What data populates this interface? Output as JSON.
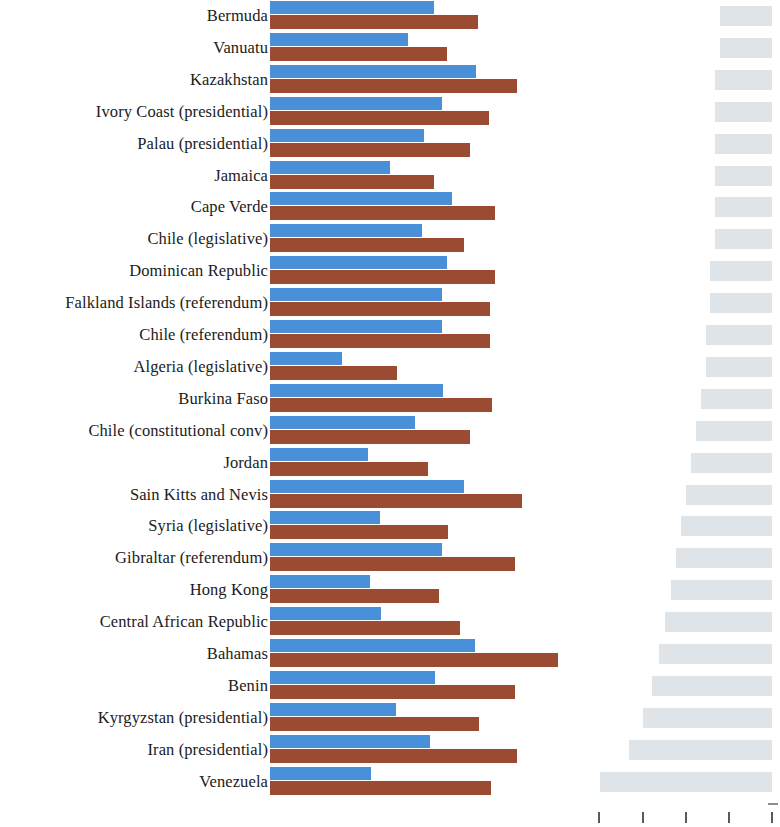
{
  "chart_data": {
    "type": "bar",
    "orientation": "horizontal",
    "title": "",
    "subtitle": "",
    "xlabel": "",
    "ylabel": "",
    "grid": false,
    "legend": null,
    "panels": [
      {
        "name": "paired-bars-panel",
        "position": "left",
        "bar_origin_x_px": 270,
        "series": [
          {
            "name": "series-blue",
            "color": "#4a90d9"
          },
          {
            "name": "series-brown",
            "color": "#9c4b33"
          }
        ]
      },
      {
        "name": "gray-bars-panel",
        "position": "right",
        "bar_alignment": "right",
        "series": [
          {
            "name": "series-gray",
            "color": "#dfe4e8"
          }
        ],
        "axis": {
          "ticks_count": 5,
          "tick_labels": [
            "",
            "",
            "",
            "",
            ""
          ],
          "tick_positions_px": [
            598,
            642,
            685,
            728,
            771
          ]
        }
      }
    ],
    "categories": [
      "Bermuda",
      "Vanuatu",
      "Kazakhstan",
      "Ivory Coast (presidential)",
      "Palau (presidential)",
      "Jamaica",
      "Cape Verde",
      "Chile (legislative)",
      "Dominican Republic",
      "Falkland Islands (referendum)",
      "Chile (referendum)",
      "Algeria (legislative)",
      "Burkina Faso",
      "Chile (constitutional conv)",
      "Jordan",
      "Sain Kitts and Nevis",
      "Syria (legislative)",
      "Gibraltar (referendum)",
      "Hong Kong",
      "Central African Republic",
      "Bahamas",
      "Benin",
      "Kyrgyzstan (presidential)",
      "Iran (presidential)",
      "Venezuela"
    ],
    "rows": [
      {
        "label": "Bermuda",
        "blue_px": 164,
        "brown_px": 208,
        "gray_px": 52
      },
      {
        "label": "Vanuatu",
        "blue_px": 138,
        "brown_px": 177,
        "gray_px": 52
      },
      {
        "label": "Kazakhstan",
        "blue_px": 206,
        "brown_px": 247,
        "gray_px": 57
      },
      {
        "label": "Ivory Coast (presidential)",
        "blue_px": 172,
        "brown_px": 219,
        "gray_px": 57
      },
      {
        "label": "Palau (presidential)",
        "blue_px": 154,
        "brown_px": 200,
        "gray_px": 57
      },
      {
        "label": "Jamaica",
        "blue_px": 120,
        "brown_px": 164,
        "gray_px": 57
      },
      {
        "label": "Cape Verde",
        "blue_px": 182,
        "brown_px": 225,
        "gray_px": 57
      },
      {
        "label": "Chile (legislative)",
        "blue_px": 152,
        "brown_px": 194,
        "gray_px": 57
      },
      {
        "label": "Dominican Republic",
        "blue_px": 177,
        "brown_px": 225,
        "gray_px": 62
      },
      {
        "label": "Falkland Islands (referendum)",
        "blue_px": 172,
        "brown_px": 220,
        "gray_px": 62
      },
      {
        "label": "Chile (referendum)",
        "blue_px": 172,
        "brown_px": 220,
        "gray_px": 66
      },
      {
        "label": "Algeria (legislative)",
        "blue_px": 72,
        "brown_px": 127,
        "gray_px": 66
      },
      {
        "label": "Burkina Faso",
        "blue_px": 173,
        "brown_px": 222,
        "gray_px": 71
      },
      {
        "label": "Chile (constitutional conv)",
        "blue_px": 145,
        "brown_px": 200,
        "gray_px": 76
      },
      {
        "label": "Jordan",
        "blue_px": 98,
        "brown_px": 158,
        "gray_px": 81
      },
      {
        "label": "Sain Kitts and Nevis",
        "blue_px": 194,
        "brown_px": 252,
        "gray_px": 86
      },
      {
        "label": "Syria (legislative)",
        "blue_px": 110,
        "brown_px": 178,
        "gray_px": 91
      },
      {
        "label": "Gibraltar (referendum)",
        "blue_px": 172,
        "brown_px": 245,
        "gray_px": 96
      },
      {
        "label": "Hong Kong",
        "blue_px": 100,
        "brown_px": 169,
        "gray_px": 101
      },
      {
        "label": "Central African Republic",
        "blue_px": 111,
        "brown_px": 190,
        "gray_px": 107
      },
      {
        "label": "Bahamas",
        "blue_px": 205,
        "brown_px": 288,
        "gray_px": 113
      },
      {
        "label": "Benin",
        "blue_px": 165,
        "brown_px": 245,
        "gray_px": 120
      },
      {
        "label": "Kyrgyzstan (presidential)",
        "blue_px": 126,
        "brown_px": 209,
        "gray_px": 129
      },
      {
        "label": "Iran (presidential)",
        "blue_px": 160,
        "brown_px": 247,
        "gray_px": 143
      },
      {
        "label": "Venezuela",
        "blue_px": 101,
        "brown_px": 221,
        "gray_px": 172
      }
    ]
  }
}
